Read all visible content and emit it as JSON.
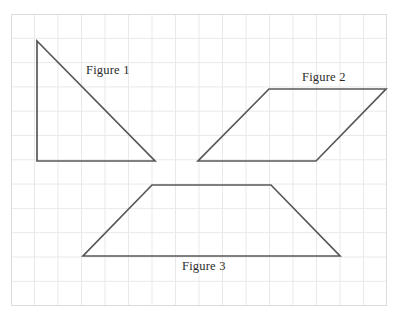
{
  "page": {
    "width": 398,
    "height": 321,
    "background_color": "#ffffff"
  },
  "grid": {
    "border_box": {
      "x": 11,
      "y": 14,
      "width": 376,
      "height": 292
    },
    "cell_width": 23.5,
    "cell_height": 24.3,
    "line_color": "#e9e9e9",
    "border_color": "#dcdcdc",
    "columns": 16,
    "rows": 12,
    "visible": true
  },
  "style": {
    "stroke_color": "#58585a",
    "stroke_width": 1.7,
    "label_color": "#2b2b2b",
    "label_font_size": 12.5
  },
  "chart_data": {
    "type": "diagram",
    "title": "",
    "xlabel": "",
    "ylabel": "",
    "grid": true,
    "legend_position": "none",
    "figures": [
      {
        "name": "Figure 1",
        "shape": "right triangle",
        "points": [
          [
            37,
            41
          ],
          [
            37,
            161
          ],
          [
            155,
            161
          ]
        ],
        "closed": true,
        "label": "Figure 1",
        "label_position": [
          86,
          64
        ]
      },
      {
        "name": "Figure 2",
        "shape": "parallelogram",
        "points": [
          [
            269,
            89
          ],
          [
            386,
            89
          ],
          [
            316,
            161
          ],
          [
            198,
            161
          ]
        ],
        "closed": true,
        "label": "Figure 2",
        "label_position": [
          302,
          71
        ]
      },
      {
        "name": "Figure 3",
        "shape": "trapezoid",
        "points": [
          [
            152,
            185
          ],
          [
            271,
            185
          ],
          [
            340,
            256
          ],
          [
            83,
            256
          ]
        ],
        "closed": true,
        "label": "Figure 3",
        "label_position": [
          182,
          260
        ]
      }
    ]
  },
  "labels": {
    "figure_1": "Figure 1",
    "figure_2": "Figure 2",
    "figure_3": "Figure 3"
  }
}
